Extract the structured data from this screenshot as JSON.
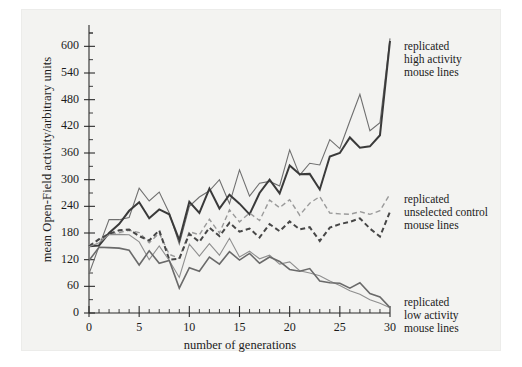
{
  "figure": {
    "background_color": "#f3f3f1",
    "page_color": "#ffffff"
  },
  "chart_data": {
    "type": "line",
    "title": "",
    "xlabel": "number of generations",
    "ylabel": "mean Open-Field activity/arbitrary units",
    "xlim": [
      0,
      30
    ],
    "ylim": [
      0,
      630
    ],
    "xticks": [
      0,
      5,
      10,
      15,
      20,
      25,
      30
    ],
    "xtick_labels": [
      "0",
      "5",
      "10",
      "15",
      "20",
      "25",
      "30"
    ],
    "x_minor_tick_step": 1,
    "yticks": [
      0,
      60,
      120,
      180,
      240,
      300,
      360,
      420,
      480,
      540,
      600
    ],
    "ytick_labels": [
      "0",
      "60",
      "120",
      "180",
      "240",
      "300",
      "360",
      "420",
      "480",
      "540",
      "600"
    ],
    "y_minor_tick_step": 30,
    "grid": false,
    "legend_position": "right-inline-annotations",
    "x": [
      0,
      1,
      2,
      3,
      4,
      5,
      6,
      7,
      8,
      9,
      10,
      11,
      12,
      13,
      14,
      15,
      16,
      17,
      18,
      19,
      20,
      21,
      22,
      23,
      24,
      25,
      26,
      27,
      28,
      29,
      30
    ],
    "series": [
      {
        "name": "high activity line A",
        "group": "replicated high activity mouse lines",
        "color": "#6f6f6f",
        "style": "solid",
        "width": 1.1,
        "values": [
          88,
          150,
          210,
          210,
          215,
          281,
          252,
          272,
          225,
          155,
          240,
          261,
          275,
          300,
          246,
          322,
          263,
          292,
          296,
          286,
          367,
          310,
          337,
          333,
          390,
          370,
          432,
          492,
          410,
          428,
          618
        ]
      },
      {
        "name": "high activity line B",
        "group": "replicated high activity mouse lines",
        "color": "#3a3a3a",
        "style": "solid",
        "width": 2.0,
        "values": [
          150,
          152,
          180,
          200,
          230,
          249,
          213,
          233,
          222,
          164,
          250,
          225,
          280,
          235,
          266,
          246,
          222,
          270,
          300,
          269,
          332,
          312,
          313,
          278,
          352,
          360,
          395,
          372,
          375,
          400,
          612
        ]
      },
      {
        "name": "unselected control line A",
        "group": "replicated unselected control mouse lines",
        "color": "#9a9a9a",
        "style": "dashed",
        "width": 1.4,
        "values": [
          152,
          165,
          176,
          181,
          186,
          181,
          158,
          180,
          132,
          123,
          183,
          176,
          211,
          180,
          232,
          205,
          225,
          208,
          254,
          237,
          255,
          220,
          247,
          262,
          225,
          223,
          222,
          228,
          222,
          230,
          268
        ]
      },
      {
        "name": "unselected control line B",
        "group": "replicated unselected control mouse lines",
        "color": "#474747",
        "style": "dashed",
        "width": 2.0,
        "values": [
          150,
          166,
          178,
          186,
          188,
          173,
          163,
          186,
          120,
          122,
          178,
          160,
          192,
          173,
          203,
          183,
          190,
          170,
          200,
          184,
          206,
          188,
          193,
          162,
          192,
          200,
          205,
          213,
          190,
          172,
          228
        ]
      },
      {
        "name": "low activity line A",
        "group": "replicated low activity mouse lines",
        "color": "#8f8f8f",
        "style": "solid",
        "width": 1.1,
        "values": [
          149,
          158,
          176,
          177,
          176,
          160,
          120,
          151,
          118,
          80,
          155,
          128,
          156,
          130,
          168,
          126,
          139,
          122,
          130,
          110,
          115,
          95,
          90,
          84,
          72,
          62,
          50,
          42,
          30,
          22,
          12
        ]
      },
      {
        "name": "low activity line B",
        "group": "replicated low activity mouse lines",
        "color": "#6a6a6a",
        "style": "solid",
        "width": 1.6,
        "values": [
          118,
          148,
          147,
          146,
          141,
          108,
          140,
          112,
          118,
          56,
          102,
          94,
          126,
          110,
          138,
          119,
          134,
          112,
          126,
          116,
          98,
          94,
          100,
          72,
          68,
          67,
          56,
          68,
          44,
          36,
          12
        ]
      }
    ],
    "annotations": [
      {
        "id": "annot-high",
        "lines": [
          "replicated",
          "high activity",
          "mouse lines"
        ]
      },
      {
        "id": "annot-control",
        "lines": [
          "replicated",
          "unselected control",
          "mouse lines"
        ]
      },
      {
        "id": "annot-low",
        "lines": [
          "replicated",
          "low activity",
          "mouse lines"
        ]
      }
    ]
  }
}
